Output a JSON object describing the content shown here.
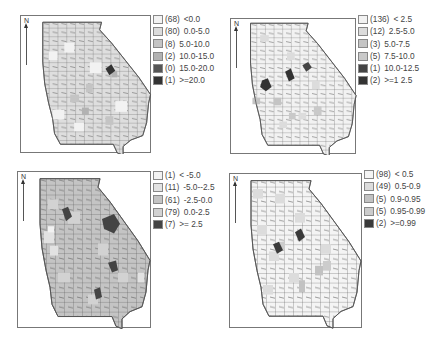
{
  "maps": [
    {
      "id": "top-left",
      "north_label": "N",
      "legend": [
        {
          "count": "(68)",
          "range": "<0.0",
          "color": "#f2f2f2"
        },
        {
          "count": "(80)",
          "range": "0.0-5.0",
          "color": "#dcdcdc"
        },
        {
          "count": "(8)",
          "range": "5.0-10.0",
          "color": "#c4c4c4"
        },
        {
          "count": "(2)",
          "range": "10.0-15.0",
          "color": "#b2b2b2"
        },
        {
          "count": "(0)",
          "range": "15.0-20.0",
          "color": "#555555"
        },
        {
          "count": "(1)",
          "range": ">=20.0",
          "color": "#333333"
        }
      ]
    },
    {
      "id": "top-right",
      "north_label": "N",
      "legend": [
        {
          "count": "(136)",
          "range": "< 2.5",
          "color": "#f2f2f2"
        },
        {
          "count": "(12)",
          "range": "2.5-5.0",
          "color": "#dcdcdc"
        },
        {
          "count": "(3)",
          "range": "5.0-7.5",
          "color": "#c4c4c4"
        },
        {
          "count": "(5)",
          "range": "7.5-10.0",
          "color": "#c9c9c9"
        },
        {
          "count": "(1)",
          "range": "10.0-12.5",
          "color": "#444444"
        },
        {
          "count": "(2)",
          "range": ">=1 2.5",
          "color": "#333333"
        }
      ]
    },
    {
      "id": "bottom-left",
      "north_label": "N",
      "legend": [
        {
          "count": "(1)",
          "range": "< -5.0",
          "color": "#f2f2f2"
        },
        {
          "count": "(11)",
          "range": "-5.0--2.5",
          "color": "#e2e2e2"
        },
        {
          "count": "(61)",
          "range": "-2.5-0.0",
          "color": "#c4c4c4"
        },
        {
          "count": "(79)",
          "range": "0.0-2.5",
          "color": "#d2d2d2"
        },
        {
          "count": "(7)",
          "range": ">= 2.5",
          "color": "#444444"
        }
      ]
    },
    {
      "id": "bottom-right",
      "north_label": "N",
      "legend": [
        {
          "count": "(98)",
          "range": "< 0.5",
          "color": "#f4f4f4"
        },
        {
          "count": "(49)",
          "range": "0.5-0.9",
          "color": "#dcdcdc"
        },
        {
          "count": "(5)",
          "range": "0.9-0.95",
          "color": "#c2c2c2"
        },
        {
          "count": "(5)",
          "range": "0.95-0.99",
          "color": "#cccccc"
        },
        {
          "count": "(2)",
          "range": ">=0.99",
          "color": "#3a3a3a"
        }
      ]
    }
  ]
}
